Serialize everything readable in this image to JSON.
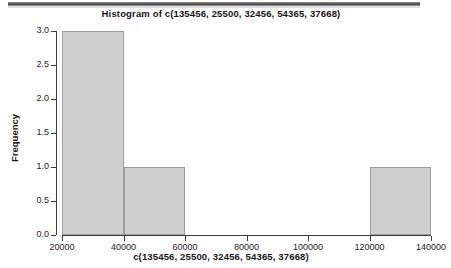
{
  "chart_data": {
    "type": "bar",
    "title": "Histogram of c(135456, 25500, 32456, 54365, 37668)",
    "xlabel": "c(135456, 25500, 32456, 54365, 37668)",
    "ylabel": "Frequency",
    "grid": false,
    "legend": "none",
    "xlim": [
      20000,
      140000
    ],
    "ylim": [
      0,
      3
    ],
    "xticks": [
      "20000",
      "40000",
      "60000",
      "80000",
      "100000",
      "120000",
      "140000"
    ],
    "xtick_values": [
      20000,
      40000,
      60000,
      80000,
      100000,
      120000,
      140000
    ],
    "yticks": [
      "0.0",
      "0.5",
      "1.0",
      "1.5",
      "2.0",
      "2.5",
      "3.0"
    ],
    "ytick_values": [
      0.0,
      0.5,
      1.0,
      1.5,
      2.0,
      2.5,
      3.0
    ],
    "bin_width": 20000,
    "categories": [
      "20000-40000",
      "40000-60000",
      "60000-80000",
      "80000-100000",
      "100000-120000",
      "120000-140000"
    ],
    "bins": [
      {
        "start": 20000,
        "end": 40000,
        "value": 3
      },
      {
        "start": 40000,
        "end": 60000,
        "value": 1
      },
      {
        "start": 60000,
        "end": 80000,
        "value": 0
      },
      {
        "start": 80000,
        "end": 100000,
        "value": 0
      },
      {
        "start": 100000,
        "end": 120000,
        "value": 0
      },
      {
        "start": 120000,
        "end": 140000,
        "value": 1
      }
    ],
    "values": [
      3,
      1,
      0,
      0,
      0,
      1
    ],
    "bar_fill": "#cfcfcf",
    "bar_border": "#9d9d9d",
    "axis_color": "#3d3d3d",
    "background": "#ffffff"
  },
  "artifacts": {
    "top_strip": "scan-edge-strip"
  }
}
